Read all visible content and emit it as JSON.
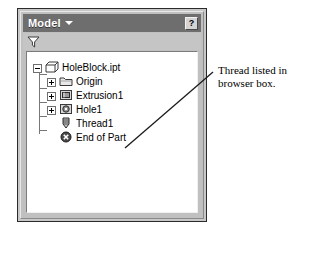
{
  "panel": {
    "title": "Model",
    "dropdown_icon": "chevron-down-icon",
    "help_label": "?",
    "filter_icon": "filter-funnel-icon"
  },
  "tree": {
    "nodes": [
      {
        "label": "HoleBlock.ipt",
        "icon": "part-document-icon",
        "expander": "minus",
        "depth": 0
      },
      {
        "label": "Origin",
        "icon": "folder-icon",
        "expander": "plus",
        "depth": 1
      },
      {
        "label": "Extrusion1",
        "icon": "extrusion-feature-icon",
        "expander": "plus",
        "depth": 1
      },
      {
        "label": "Hole1",
        "icon": "hole-feature-icon",
        "expander": "plus",
        "depth": 1
      },
      {
        "label": "Thread1",
        "icon": "thread-feature-icon",
        "expander": "none",
        "depth": 1
      },
      {
        "label": "End of Part",
        "icon": "end-of-part-icon",
        "expander": "none",
        "depth": 1
      }
    ]
  },
  "annotation": {
    "line1": "Thread listed in",
    "line2": "browser box."
  },
  "colors": {
    "title_bar": "#6e6e6e",
    "panel_face": "#c0c0c0",
    "tree_background": "#ffffff",
    "text": "#000000",
    "title_text": "#ffffff"
  }
}
